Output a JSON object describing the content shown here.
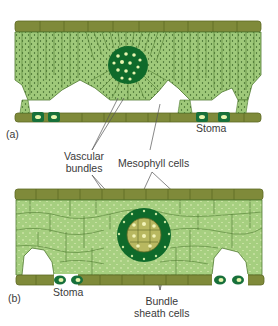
{
  "figure": {
    "panel_a": {
      "label": "(a)"
    },
    "panel_b": {
      "label": "(b)"
    },
    "labels": {
      "stoma_a": "Stoma",
      "vascular_line1": "Vascular",
      "vascular_line2": "bundles",
      "mesophyll": "Mesophyll cells",
      "stoma_b": "Stoma",
      "bundle_line1": "Bundle",
      "bundle_line2": "sheath cells"
    },
    "colors": {
      "epidermis": "#7f8a3a",
      "epidermis_edge": "#5e6a25",
      "mesophyll": "#9fc97a",
      "mesophyll_edge": "#4f7a30",
      "chloroplast": "#2f5a1f",
      "bundle_sheath": "#0f6a2a",
      "bundle_dot": "#e8f5b0",
      "vascular_core": "#b8b860",
      "guard_cell": "#17703a"
    }
  }
}
